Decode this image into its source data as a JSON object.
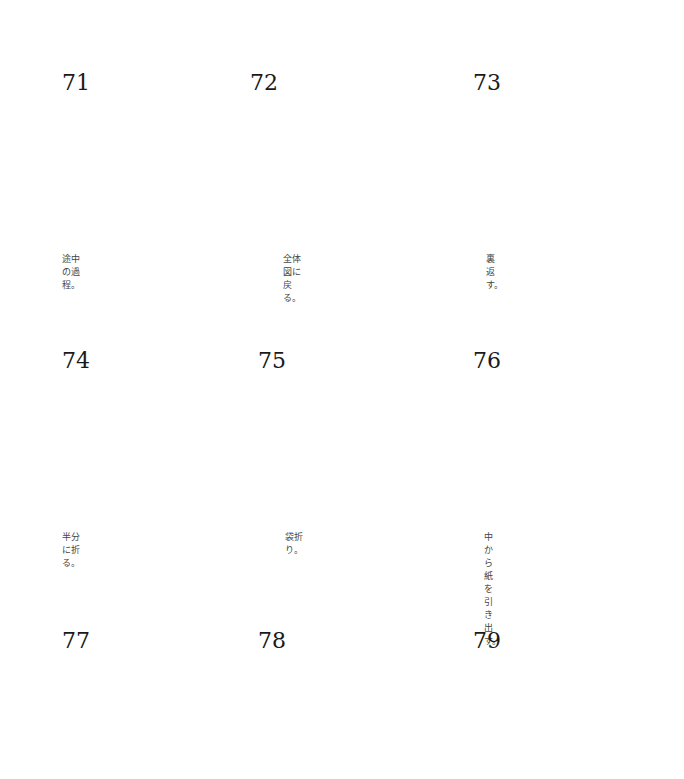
{
  "colors": {
    "paper_green": "#b1c16a",
    "line": "#1d1d1d",
    "valley_fold": "#7fa6d4",
    "crease": "#8a9a55"
  },
  "steps": [
    {
      "number": "71",
      "caption": "途中の過程。"
    },
    {
      "number": "72",
      "caption": "全体図に戻る。"
    },
    {
      "number": "73",
      "caption": "裏返す。"
    },
    {
      "number": "74",
      "caption": "半分に折る。"
    },
    {
      "number": "75",
      "caption": "袋折り。"
    },
    {
      "number": "76",
      "caption": "中から紙を引き出す。"
    },
    {
      "number": "77",
      "caption": ""
    },
    {
      "number": "78",
      "caption": ""
    },
    {
      "number": "79",
      "caption": ""
    }
  ]
}
